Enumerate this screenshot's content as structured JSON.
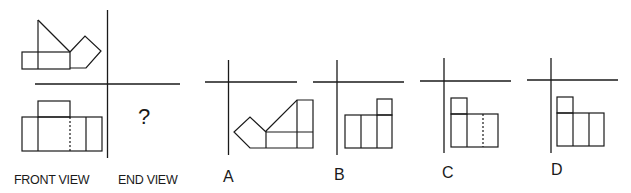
{
  "problem": {
    "question_mark": "?",
    "view_labels": {
      "front": "FRONT VIEW",
      "end": "END VIEW"
    },
    "options": [
      {
        "id": "A",
        "label": "A"
      },
      {
        "id": "B",
        "label": "B"
      },
      {
        "id": "C",
        "label": "C"
      },
      {
        "id": "D",
        "label": "D"
      }
    ]
  },
  "colors": {
    "line": "#1a1a1a",
    "background": "#ffffff"
  }
}
